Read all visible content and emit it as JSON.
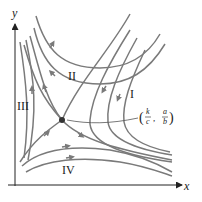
{
  "diagram": {
    "type": "phase-portrait",
    "axes": {
      "x_label": "x",
      "y_label": "y"
    },
    "regions": [
      {
        "id": "I",
        "label": "I"
      },
      {
        "id": "II",
        "label": "II"
      },
      {
        "id": "III",
        "label": "III"
      },
      {
        "id": "IV",
        "label": "IV"
      }
    ],
    "equilibrium": {
      "label_open": "(",
      "label_x_num": "k",
      "label_x_den": "c",
      "label_sep": ",",
      "label_y_num": "a",
      "label_y_den": "b",
      "label_close": ")"
    },
    "colors": {
      "curves": "#7a7a7a",
      "axes": "#222222",
      "point": "#333333"
    }
  }
}
